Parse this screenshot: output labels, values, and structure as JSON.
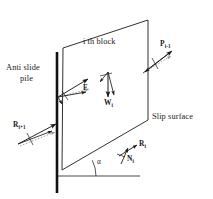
{
  "figure": {
    "title_block": "i th block",
    "labels": {
      "anti_slide_pile_line1": "Anti slide",
      "anti_slide_pile_line2": "pile",
      "slip_surface": "Slip surface"
    },
    "forces": [
      {
        "name": "F",
        "symbol": "F",
        "subscript": "",
        "x": 83,
        "y": 84,
        "desc": "anti-slide-force-F"
      },
      {
        "name": "Wi",
        "symbol": "W",
        "subscript": "i",
        "x": 104,
        "y": 99,
        "desc": "block-weight-Wi"
      },
      {
        "name": "Pi-1",
        "symbol": "P",
        "subscript": "i-1",
        "x": 160,
        "y": 41,
        "desc": "interslice-force-Pi-1"
      },
      {
        "name": "Ri+1",
        "symbol": "R",
        "subscript": "i+1",
        "x": 14,
        "y": 121,
        "desc": "interslice-force-Ri+1"
      },
      {
        "name": "Ri",
        "symbol": "R",
        "subscript": "i",
        "x": 139,
        "y": 141,
        "desc": "resultant-force-Ri"
      },
      {
        "name": "Ni",
        "symbol": "N",
        "subscript": "i",
        "x": 127,
        "y": 156,
        "desc": "normal-force-Ni"
      }
    ],
    "angle_symbol": "α",
    "angle_x": 98,
    "angle_y": 159,
    "colors": {
      "stroke": "#1a1a1a",
      "pile": "#111111",
      "dotted": "#9a9a9a",
      "background": "#ffffff"
    },
    "geometry": {
      "pile_top_y": 52,
      "pile_bottom_y": 193,
      "pile_x": 57,
      "block_top_left": [
        63,
        48
      ],
      "block_top_right": [
        148,
        20
      ],
      "block_right_bottom": [
        148,
        120
      ],
      "slip_left": [
        62,
        170
      ],
      "slip_right": [
        148,
        120
      ],
      "ground_line_y": 176
    }
  }
}
